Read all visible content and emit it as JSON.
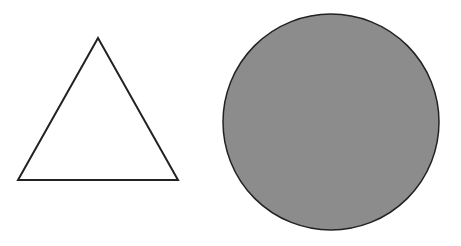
{
  "canvas": {
    "width": 461,
    "height": 246,
    "background": "#ffffff"
  },
  "shapes": [
    {
      "type": "triangle",
      "points": "98,38 18,180 178,180",
      "fill": "#ffffff",
      "stroke": "#222222",
      "stroke_width": 2
    },
    {
      "type": "circle",
      "cx": 331,
      "cy": 122,
      "r": 108,
      "fill": "#8c8c8c",
      "stroke": "#222222",
      "stroke_width": 1.5
    }
  ]
}
